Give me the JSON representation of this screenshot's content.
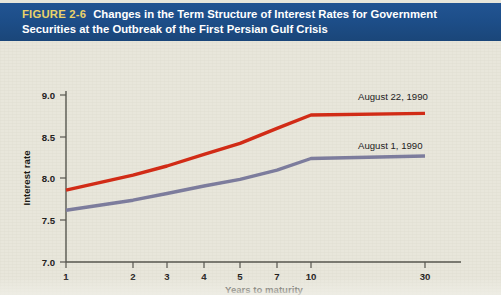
{
  "figure": {
    "tag": "FIGURE 2-6",
    "title_line1": "Changes in the Term Structure of Interest Rates for Government",
    "title_line2": "Securities at the Outbreak of the First Persian Gulf Crisis",
    "header_bg": "#1d4e89",
    "tag_color": "#e9d26a",
    "plot_bg": "#e8e6db"
  },
  "chart_data": {
    "type": "line",
    "title": "Changes in the Term Structure of Interest Rates for Government Securities at the Outbreak of the First Persian Gulf Crisis",
    "xlabel": "Years to maturity",
    "ylabel": "Interest rate",
    "x_tick_labels": [
      "1",
      "2",
      "3",
      "4",
      "5",
      "7",
      "10",
      "30"
    ],
    "x": [
      1,
      2,
      3,
      4,
      5,
      7,
      10,
      30
    ],
    "y_tick_labels": [
      "7.0",
      "7.5",
      "8.0",
      "8.5",
      "9.0"
    ],
    "y_ticks": [
      7.0,
      7.5,
      8.0,
      8.5,
      9.0
    ],
    "ylim": [
      7.0,
      9.0
    ],
    "grid": false,
    "legend": "inline-end-labels",
    "series": [
      {
        "name": "August 22, 1990",
        "color": "#d32b16",
        "values": [
          7.86,
          8.04,
          8.15,
          8.29,
          8.42,
          8.6,
          8.76,
          8.78
        ]
      },
      {
        "name": "August 1, 1990",
        "color": "#7d7d9e",
        "values": [
          7.62,
          7.74,
          7.82,
          7.91,
          7.99,
          8.1,
          8.24,
          8.27
        ]
      }
    ]
  },
  "axis_style": {
    "axis_color": "#57564f",
    "tick_color": "#57564f",
    "text_color": "#23211d"
  }
}
